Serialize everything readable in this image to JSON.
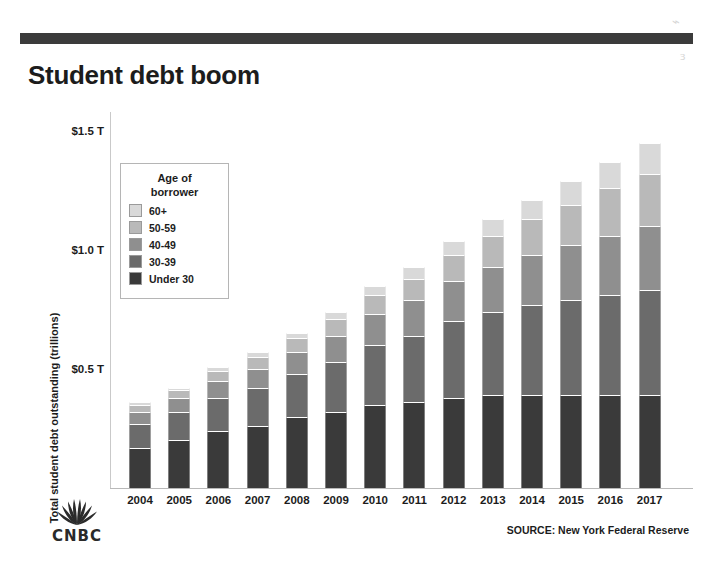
{
  "title": "Student debt boom",
  "source": "SOURCE: New York Federal Reserve",
  "brand": {
    "name": "CNBC",
    "logo_icon": "cnbc-peacock-icon"
  },
  "colors": {
    "rule": "#3b3b3b",
    "text": "#1c1c1c",
    "series": [
      "#d9d9d9",
      "#b9b9b9",
      "#8f8f8f",
      "#6b6b6b",
      "#3a3a3a"
    ]
  },
  "chart_data": {
    "type": "bar",
    "stacked": true,
    "title": "Student debt boom",
    "xlabel": "",
    "ylabel": "Total student debt outstanding (trillions)",
    "ylim": [
      0,
      1.58
    ],
    "yticks": [
      0.5,
      1.0,
      1.5
    ],
    "ytick_labels": [
      "$0.5 T",
      "$1.0 T",
      "$1.5 T"
    ],
    "grid": false,
    "legend_title": "Age of borrower",
    "legend_position": "inside-upper-left",
    "categories": [
      "2004",
      "2005",
      "2006",
      "2007",
      "2008",
      "2009",
      "2010",
      "2011",
      "2012",
      "2013",
      "2014",
      "2015",
      "2016",
      "2017"
    ],
    "series": [
      {
        "name": "Under 30",
        "color": "#3a3a3a",
        "values": [
          0.17,
          0.2,
          0.24,
          0.26,
          0.3,
          0.32,
          0.35,
          0.36,
          0.38,
          0.39,
          0.39,
          0.39,
          0.39,
          0.39
        ]
      },
      {
        "name": "30-39",
        "color": "#6b6b6b",
        "values": [
          0.1,
          0.12,
          0.14,
          0.16,
          0.18,
          0.21,
          0.25,
          0.28,
          0.32,
          0.35,
          0.38,
          0.4,
          0.42,
          0.44
        ]
      },
      {
        "name": "40-49",
        "color": "#8f8f8f",
        "values": [
          0.05,
          0.06,
          0.07,
          0.08,
          0.09,
          0.11,
          0.13,
          0.15,
          0.17,
          0.19,
          0.21,
          0.23,
          0.25,
          0.27
        ]
      },
      {
        "name": "50-59",
        "color": "#b9b9b9",
        "values": [
          0.03,
          0.03,
          0.04,
          0.05,
          0.06,
          0.07,
          0.08,
          0.09,
          0.11,
          0.13,
          0.15,
          0.17,
          0.2,
          0.22
        ]
      },
      {
        "name": "60+",
        "color": "#d9d9d9",
        "values": [
          0.01,
          0.01,
          0.02,
          0.02,
          0.02,
          0.03,
          0.04,
          0.05,
          0.06,
          0.07,
          0.08,
          0.1,
          0.11,
          0.13
        ]
      }
    ],
    "totals": [
      0.36,
      0.42,
      0.51,
      0.57,
      0.65,
      0.74,
      0.85,
      0.93,
      1.04,
      1.13,
      1.21,
      1.29,
      1.37,
      1.45
    ]
  },
  "legend": {
    "title_line1": "Age of",
    "title_line2": "borrower",
    "items": [
      {
        "label": "60+",
        "color": "#d9d9d9"
      },
      {
        "label": "50-59",
        "color": "#b9b9b9"
      },
      {
        "label": "40-49",
        "color": "#8f8f8f"
      },
      {
        "label": "30-39",
        "color": "#6b6b6b"
      },
      {
        "label": "Under 30",
        "color": "#3a3a3a"
      }
    ]
  }
}
